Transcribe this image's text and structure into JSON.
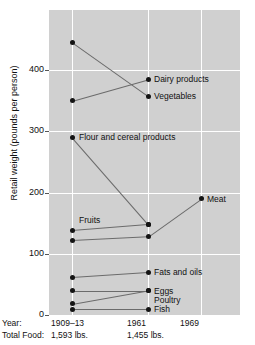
{
  "chart_data": {
    "type": "line",
    "title": "",
    "xlabel": "Year",
    "ylabel": "Retail weight (pounds per person)",
    "grid": true,
    "legend_position": "inline-right",
    "x": [
      "1909–13",
      "1961",
      "1969"
    ],
    "xtick_labels": [
      "1909–13",
      "1961",
      "1969"
    ],
    "ytick_labels": [
      "0",
      "100",
      "200",
      "300",
      "400"
    ],
    "ytick_values": [
      0,
      100,
      200,
      300,
      400
    ],
    "ylim": [
      0,
      470
    ],
    "row_headers": {
      "year": "Year:",
      "total_food": "Total Food:"
    },
    "total_food": [
      "1,593 lbs.",
      "1,455 lbs.",
      ""
    ],
    "series": [
      {
        "name": "Vegetables",
        "label": "Vegetables",
        "values": [
          445,
          357,
          null
        ]
      },
      {
        "name": "Dairy products",
        "label": "Dairy products",
        "values": [
          350,
          385,
          null
        ]
      },
      {
        "name": "Flour and cereal products",
        "label": "Flour and cereal products",
        "values": [
          290,
          148,
          null
        ]
      },
      {
        "name": "Meat",
        "label": "Meat",
        "values": [
          122,
          128,
          190
        ]
      },
      {
        "name": "Fruits",
        "label": "Fruits",
        "values": [
          138,
          148,
          null
        ]
      },
      {
        "name": "Fats and oils",
        "label": "Fats and oils",
        "values": [
          62,
          70,
          null
        ]
      },
      {
        "name": "Eggs",
        "label": "Eggs",
        "values": [
          40,
          40,
          null
        ]
      },
      {
        "name": "Poultry",
        "label": "Poultry",
        "values": [
          18,
          40,
          null
        ]
      },
      {
        "name": "Fish",
        "label": "Fish",
        "values": [
          9,
          9,
          null
        ]
      }
    ],
    "annotations": [
      {
        "text": "Dairy products",
        "anchor_x": "1961",
        "anchor_y": 385
      },
      {
        "text": "Vegetables",
        "anchor_x": "1961",
        "anchor_y": 357
      },
      {
        "text": "Flour and cereal products",
        "anchor_x": "1909–13",
        "anchor_y": 290
      },
      {
        "text": "Meat",
        "anchor_x": "1969",
        "anchor_y": 190
      },
      {
        "text": "Fruits",
        "anchor_x": "1909–13",
        "anchor_y": 155
      },
      {
        "text": "Fats and oils",
        "anchor_x": "1961",
        "anchor_y": 70
      },
      {
        "text": "Eggs",
        "anchor_x": "1961",
        "anchor_y": 40
      },
      {
        "text": "Poultry",
        "anchor_x": "1961",
        "anchor_y": 25
      },
      {
        "text": "Fish",
        "anchor_x": "1961",
        "anchor_y": 9
      }
    ],
    "colors": {
      "panel_background": "#d0d0d0",
      "gridline": "#ffffff",
      "line": "#6b6b6b",
      "marker": "#141414",
      "text": "#111111",
      "page_background": "#ffffff"
    }
  }
}
